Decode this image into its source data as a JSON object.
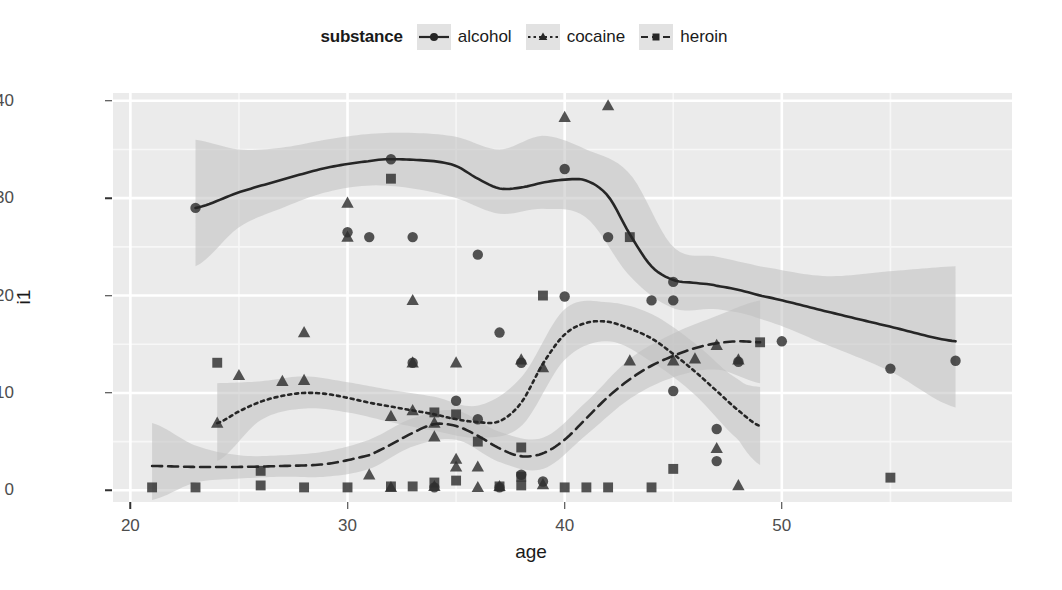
{
  "legend": {
    "title": "substance",
    "items": [
      {
        "label": "alcohol",
        "marker": "circle-marker",
        "line": "solid",
        "color": "#262626"
      },
      {
        "label": "cocaine",
        "marker": "triangle-marker",
        "line": "dotted",
        "color": "#262626"
      },
      {
        "label": "heroin",
        "marker": "square-marker",
        "line": "dashed",
        "color": "#262626"
      }
    ]
  },
  "axes": {
    "x_title": "age",
    "y_title": "i1",
    "x_ticks": [
      20,
      30,
      40,
      50
    ],
    "y_ticks": [
      0,
      10,
      20,
      30,
      40
    ],
    "x_tick_labels": [
      "20",
      "30",
      "40",
      "50"
    ],
    "y_tick_labels": [
      "0",
      "10",
      "20",
      "30",
      "40"
    ],
    "xlim": [
      19.2,
      60.6
    ],
    "ylim": [
      -1.2,
      40.8
    ]
  },
  "style": {
    "panel_bg": "#ebebeb",
    "grid_major": "#ffffff",
    "grid_minor": "#f7f7f7",
    "ribbon": "#bfbfbf",
    "line": "#262626",
    "axis_text": "#4d4d4d",
    "title_text": "#1a1a1a"
  },
  "chart_data": {
    "type": "scatter",
    "title": "",
    "subtitle": "",
    "xlabel": "age",
    "ylabel": "i1",
    "xlim": [
      19.2,
      60.6
    ],
    "ylim": [
      -1.2,
      40.8
    ],
    "grid": true,
    "legend_position": "top",
    "legend_title": "substance",
    "series": [
      {
        "name": "alcohol",
        "marker": "circle",
        "linestyle": "solid",
        "points": [
          [
            23,
            29.0
          ],
          [
            30,
            26.5
          ],
          [
            31,
            26.0
          ],
          [
            33,
            26.0
          ],
          [
            36,
            24.2
          ],
          [
            35,
            9.2
          ],
          [
            36,
            7.3
          ],
          [
            37,
            16.2
          ],
          [
            38,
            13.1
          ],
          [
            33,
            13.1
          ],
          [
            32,
            34.0
          ],
          [
            40,
            33.0
          ],
          [
            40,
            19.9
          ],
          [
            42,
            26.0
          ],
          [
            44,
            19.5
          ],
          [
            45,
            19.5
          ],
          [
            45,
            21.4
          ],
          [
            45,
            10.2
          ],
          [
            47,
            6.3
          ],
          [
            47,
            3.0
          ],
          [
            48,
            13.2
          ],
          [
            50,
            15.3
          ],
          [
            55,
            12.5
          ],
          [
            58,
            13.3
          ],
          [
            38,
            1.6
          ],
          [
            39,
            0.9
          ],
          [
            37,
            0.3
          ],
          [
            34,
            0.3
          ]
        ],
        "smooth": [
          [
            23,
            29.0
          ],
          [
            25,
            30.6
          ],
          [
            27,
            31.9
          ],
          [
            29,
            33.1
          ],
          [
            31,
            33.8
          ],
          [
            32,
            34.0
          ],
          [
            34,
            33.8
          ],
          [
            35,
            33.3
          ],
          [
            36,
            32.0
          ],
          [
            37,
            31.0
          ],
          [
            38,
            31.1
          ],
          [
            39,
            31.6
          ],
          [
            40,
            31.9
          ],
          [
            41,
            31.8
          ],
          [
            42,
            30.2
          ],
          [
            43,
            26.3
          ],
          [
            44,
            23.0
          ],
          [
            45,
            21.6
          ],
          [
            46,
            21.3
          ],
          [
            47,
            21.0
          ],
          [
            49,
            20.0
          ],
          [
            52,
            18.4
          ],
          [
            55,
            16.8
          ],
          [
            58,
            15.3
          ]
        ],
        "ribbon_lower": [
          [
            23,
            23.0
          ],
          [
            25,
            27.0
          ],
          [
            27,
            29.0
          ],
          [
            29,
            30.6
          ],
          [
            31,
            31.3
          ],
          [
            33,
            31.0
          ],
          [
            35,
            30.0
          ],
          [
            37,
            28.4
          ],
          [
            39,
            28.9
          ],
          [
            41,
            28.0
          ],
          [
            43,
            22.0
          ],
          [
            45,
            18.7
          ],
          [
            47,
            18.6
          ],
          [
            49,
            17.6
          ],
          [
            52,
            15.0
          ],
          [
            55,
            12.2
          ],
          [
            58,
            8.5
          ]
        ],
        "ribbon_upper": [
          [
            23,
            36.0
          ],
          [
            25,
            35.0
          ],
          [
            27,
            35.2
          ],
          [
            29,
            36.0
          ],
          [
            31,
            36.6
          ],
          [
            33,
            36.7
          ],
          [
            35,
            36.3
          ],
          [
            37,
            35.0
          ],
          [
            39,
            36.4
          ],
          [
            41,
            35.0
          ],
          [
            43,
            32.5
          ],
          [
            45,
            25.0
          ],
          [
            47,
            24.0
          ],
          [
            49,
            23.0
          ],
          [
            52,
            22.0
          ],
          [
            55,
            22.5
          ],
          [
            58,
            23.0
          ]
        ]
      },
      {
        "name": "cocaine",
        "marker": "triangle",
        "linestyle": "dotted",
        "points": [
          [
            30,
            29.5
          ],
          [
            30,
            26.0
          ],
          [
            33,
            19.5
          ],
          [
            28,
            16.2
          ],
          [
            24,
            6.9
          ],
          [
            25,
            11.8
          ],
          [
            27,
            11.2
          ],
          [
            28,
            11.3
          ],
          [
            32,
            7.6
          ],
          [
            33,
            8.2
          ],
          [
            34,
            5.5
          ],
          [
            34,
            6.9
          ],
          [
            35,
            3.2
          ],
          [
            35,
            2.4
          ],
          [
            36,
            2.4
          ],
          [
            33,
            13.1
          ],
          [
            35,
            13.1
          ],
          [
            40,
            38.3
          ],
          [
            42,
            39.5
          ],
          [
            38,
            13.4
          ],
          [
            39,
            12.6
          ],
          [
            43,
            13.3
          ],
          [
            45,
            13.3
          ],
          [
            46,
            13.5
          ],
          [
            47,
            14.9
          ],
          [
            48,
            13.4
          ],
          [
            47,
            4.3
          ],
          [
            48,
            0.5
          ],
          [
            37,
            0.4
          ],
          [
            34,
            0.4
          ],
          [
            31,
            1.6
          ],
          [
            32,
            0.3
          ],
          [
            36,
            0.3
          ],
          [
            39,
            0.6
          ]
        ],
        "smooth": [
          [
            24,
            6.9
          ],
          [
            25,
            8.1
          ],
          [
            26,
            9.1
          ],
          [
            27,
            9.7
          ],
          [
            28,
            10.0
          ],
          [
            29,
            9.9
          ],
          [
            30,
            9.5
          ],
          [
            31,
            9.0
          ],
          [
            32,
            8.6
          ],
          [
            33,
            8.2
          ],
          [
            34,
            7.8
          ],
          [
            35,
            7.3
          ],
          [
            36,
            7.0
          ],
          [
            37,
            7.1
          ],
          [
            38,
            9.0
          ],
          [
            39,
            13.0
          ],
          [
            40,
            16.0
          ],
          [
            41,
            17.2
          ],
          [
            42,
            17.3
          ],
          [
            43,
            16.6
          ],
          [
            44,
            15.6
          ],
          [
            45,
            14.0
          ],
          [
            46,
            12.2
          ],
          [
            47,
            10.2
          ],
          [
            48,
            8.2
          ],
          [
            49,
            6.6
          ]
        ],
        "ribbon_lower": [
          [
            24,
            3.0
          ],
          [
            26,
            7.2
          ],
          [
            28,
            8.4
          ],
          [
            30,
            8.0
          ],
          [
            32,
            7.0
          ],
          [
            34,
            6.1
          ],
          [
            36,
            5.4
          ],
          [
            38,
            6.6
          ],
          [
            40,
            13.4
          ],
          [
            42,
            15.3
          ],
          [
            44,
            13.2
          ],
          [
            46,
            9.8
          ],
          [
            48,
            5.2
          ],
          [
            49,
            2.6
          ]
        ],
        "ribbon_upper": [
          [
            24,
            11.0
          ],
          [
            26,
            11.2
          ],
          [
            28,
            11.7
          ],
          [
            30,
            11.1
          ],
          [
            32,
            10.3
          ],
          [
            34,
            9.6
          ],
          [
            36,
            8.7
          ],
          [
            38,
            11.6
          ],
          [
            40,
            18.6
          ],
          [
            42,
            19.3
          ],
          [
            44,
            18.1
          ],
          [
            46,
            15.1
          ],
          [
            48,
            11.4
          ],
          [
            49,
            10.6
          ]
        ]
      },
      {
        "name": "heroin",
        "marker": "square",
        "linestyle": "dashed",
        "points": [
          [
            24,
            13.1
          ],
          [
            32,
            32.0
          ],
          [
            39,
            20.0
          ],
          [
            43,
            26.0
          ],
          [
            21,
            0.3
          ],
          [
            23,
            0.3
          ],
          [
            26,
            0.5
          ],
          [
            26,
            2.0
          ],
          [
            28,
            0.3
          ],
          [
            30,
            0.3
          ],
          [
            32,
            0.4
          ],
          [
            33,
            0.4
          ],
          [
            34,
            8.0
          ],
          [
            34,
            0.8
          ],
          [
            35,
            7.8
          ],
          [
            35,
            1.0
          ],
          [
            36,
            5.0
          ],
          [
            38,
            4.4
          ],
          [
            38,
            0.5
          ],
          [
            38,
            1.4
          ],
          [
            40,
            0.3
          ],
          [
            41,
            0.3
          ],
          [
            44,
            0.3
          ],
          [
            45,
            2.2
          ],
          [
            49,
            15.2
          ],
          [
            55,
            1.3
          ],
          [
            37,
            0.4
          ],
          [
            42,
            0.3
          ]
        ],
        "smooth": [
          [
            21,
            2.5
          ],
          [
            23,
            2.4
          ],
          [
            25,
            2.4
          ],
          [
            27,
            2.5
          ],
          [
            29,
            2.7
          ],
          [
            31,
            3.6
          ],
          [
            32,
            4.7
          ],
          [
            33,
            5.9
          ],
          [
            34,
            6.8
          ],
          [
            35,
            6.6
          ],
          [
            36,
            5.6
          ],
          [
            37,
            4.3
          ],
          [
            38,
            3.5
          ],
          [
            39,
            3.8
          ],
          [
            40,
            5.2
          ],
          [
            41,
            7.4
          ],
          [
            42,
            9.6
          ],
          [
            43,
            11.4
          ],
          [
            44,
            12.8
          ],
          [
            45,
            13.8
          ],
          [
            46,
            14.6
          ],
          [
            47,
            15.1
          ],
          [
            48,
            15.3
          ],
          [
            49,
            15.2
          ]
        ],
        "ribbon_lower": [
          [
            21,
            -1.0
          ],
          [
            23,
            0.8
          ],
          [
            25,
            1.2
          ],
          [
            27,
            1.4
          ],
          [
            29,
            1.4
          ],
          [
            31,
            2.2
          ],
          [
            33,
            4.5
          ],
          [
            35,
            5.2
          ],
          [
            37,
            2.9
          ],
          [
            39,
            2.2
          ],
          [
            41,
            5.7
          ],
          [
            43,
            9.4
          ],
          [
            45,
            11.6
          ],
          [
            47,
            12.4
          ],
          [
            49,
            11.0
          ]
        ],
        "ribbon_upper": [
          [
            21,
            6.9
          ],
          [
            23,
            4.6
          ],
          [
            25,
            3.6
          ],
          [
            27,
            3.6
          ],
          [
            29,
            4.0
          ],
          [
            31,
            5.2
          ],
          [
            33,
            7.4
          ],
          [
            35,
            8.2
          ],
          [
            37,
            6.0
          ],
          [
            39,
            5.4
          ],
          [
            41,
            9.1
          ],
          [
            43,
            13.5
          ],
          [
            45,
            16.1
          ],
          [
            47,
            17.9
          ],
          [
            49,
            19.5
          ]
        ]
      }
    ]
  }
}
